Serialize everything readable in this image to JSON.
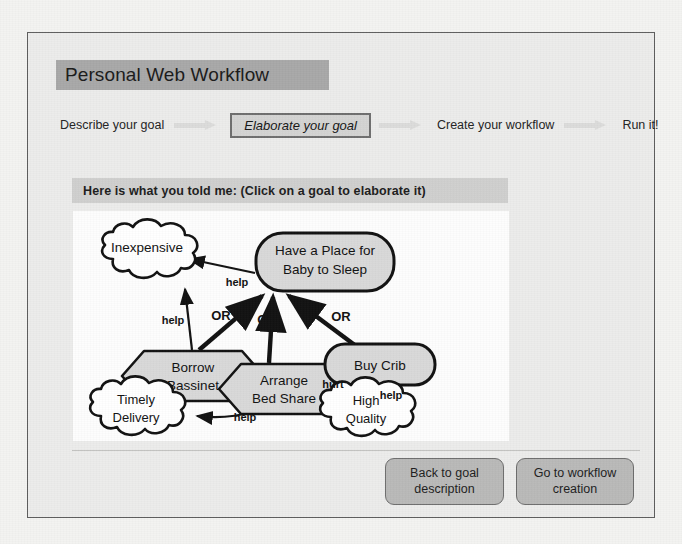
{
  "window": {
    "title": "Personal Web Workflow"
  },
  "stepper": {
    "steps": [
      {
        "label": "Describe your goal",
        "active": false
      },
      {
        "label": "Elaborate your goal",
        "active": true
      },
      {
        "label": "Create your workflow",
        "active": false
      },
      {
        "label": "Run it!",
        "active": false
      }
    ],
    "separator_icon": "arrow-right-icon"
  },
  "instruction": {
    "text": "Here is what you told me:  (Click on a goal to elaborate it)"
  },
  "diagram": {
    "nodes": [
      {
        "id": "inexpensive",
        "label_lines": [
          "Inexpensive"
        ],
        "shape": "cloud"
      },
      {
        "id": "root_goal",
        "label_lines": [
          "Have a Place for",
          "Baby to Sleep"
        ],
        "shape": "rounded-rect"
      },
      {
        "id": "borrow",
        "label_lines": [
          "Borrow",
          "Bassinet"
        ],
        "shape": "hexagon"
      },
      {
        "id": "bedshare",
        "label_lines": [
          "Arrange",
          "Bed Share"
        ],
        "shape": "hexagon"
      },
      {
        "id": "buycrib",
        "label_lines": [
          "Buy Crib"
        ],
        "shape": "rounded-rect"
      },
      {
        "id": "timely",
        "label_lines": [
          "Timely",
          "Delivery"
        ],
        "shape": "cloud"
      },
      {
        "id": "quality",
        "label_lines": [
          "High",
          "Quality"
        ],
        "shape": "cloud"
      }
    ],
    "edges": [
      {
        "from": "borrow",
        "to": "inexpensive",
        "label": "help"
      },
      {
        "from": "root_goal",
        "to": "inexpensive",
        "label": "help"
      },
      {
        "from": "borrow",
        "to": "root_goal",
        "label": "OR"
      },
      {
        "from": "bedshare",
        "to": "root_goal",
        "label": "OR"
      },
      {
        "from": "buycrib",
        "to": "root_goal",
        "label": "OR"
      },
      {
        "from": "bedshare",
        "to": "timely",
        "label": "help"
      },
      {
        "from": "bedshare",
        "to": "quality",
        "label": "hurt"
      },
      {
        "from": "buycrib",
        "to": "quality",
        "label": "help"
      }
    ],
    "node_fill": "#d9d9d9",
    "cloud_fill": "#ffffff",
    "stroke": "#111111"
  },
  "footer": {
    "buttons": [
      {
        "id": "back",
        "lines": [
          "Back to goal",
          "description"
        ]
      },
      {
        "id": "go",
        "lines": [
          "Go to workflow",
          "creation"
        ]
      }
    ]
  },
  "colors": {
    "title_bar": "#a8a8a8",
    "panel_bg": "#ececeb",
    "instruct_bar": "#cfcfce",
    "button_bg": "#b9b9b8",
    "canvas_bg": "#fdfdfd"
  }
}
